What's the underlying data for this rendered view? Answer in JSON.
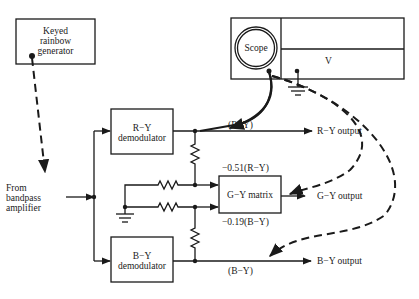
{
  "blocks": {
    "generator": {
      "lines": [
        "Keyed",
        "rainbow",
        "generator"
      ]
    },
    "scope": {
      "label": "Scope",
      "probe_label": "V"
    },
    "ry_demod": {
      "lines": [
        "R−Y",
        "demodulator"
      ]
    },
    "by_demod": {
      "lines": [
        "B−Y",
        "demodulator"
      ]
    },
    "gy_matrix": {
      "label": "G−Y matrix"
    }
  },
  "input": {
    "lines": [
      "From",
      "bandpass",
      "amplifier"
    ]
  },
  "signals": {
    "ry": "(R−Y)",
    "by": "(B−Y)",
    "ry_scaled": "−0.51(R−Y)",
    "by_scaled": "−0.19(B−Y)"
  },
  "outputs": {
    "ry": "R−Y output",
    "gy": "G−Y output",
    "by": "B−Y output"
  },
  "colors": {
    "line": "#1a1a1a",
    "background": "#ffffff"
  }
}
